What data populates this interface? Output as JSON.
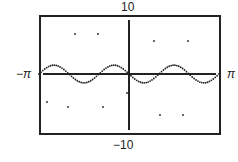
{
  "chart_data": {
    "type": "scatter",
    "title": "",
    "xlabel": "",
    "ylabel": "",
    "xlim": [
      "-π",
      "π"
    ],
    "ylim": [
      -10,
      10
    ],
    "labels": {
      "top": "10",
      "bottom": "−10",
      "left": "−π",
      "right": "π"
    },
    "grid": false,
    "series": [
      {
        "name": "curve",
        "x_peaks": [
          -1.57,
          0.52,
          2.62
        ],
        "x_troughs": [
          -2.62,
          -0.52,
          1.57
        ],
        "amplitude": 1.5
      }
    ]
  }
}
